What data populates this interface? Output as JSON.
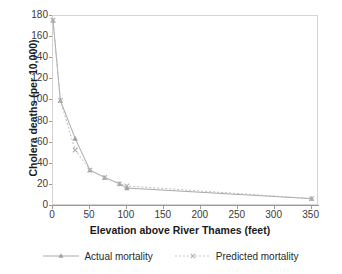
{
  "chart_data": {
    "type": "line",
    "title": "",
    "subtitle": "",
    "xlabel": "Elevation above River Thames (feet)",
    "ylabel": "Cholera deaths (per 10,000)",
    "xlim": [
      0,
      360
    ],
    "ylim": [
      0,
      180
    ],
    "xticks": [
      0,
      50,
      100,
      150,
      200,
      250,
      300,
      350
    ],
    "yticks": [
      0,
      20,
      40,
      60,
      80,
      100,
      120,
      140,
      160,
      180
    ],
    "xticklabels": [
      "0",
      "50",
      "100",
      "150",
      "200",
      "250",
      "300",
      "350"
    ],
    "yticklabels": [
      "0",
      "20",
      "40",
      "60",
      "80",
      "100",
      "120",
      "140",
      "160",
      "180"
    ],
    "grid": false,
    "legend_position": "bottom",
    "x": [
      0,
      10,
      30,
      50,
      70,
      90,
      100,
      350
    ],
    "series": [
      {
        "name": "Actual mortality",
        "values": [
          176,
          100,
          64,
          34,
          27,
          21,
          17,
          7
        ],
        "color": "#a9a9a9",
        "linestyle": "solid",
        "marker": "triangle"
      },
      {
        "name": "Predicted mortality",
        "values": [
          176,
          100,
          53,
          34,
          27,
          21,
          19,
          7
        ],
        "color": "#bdbdbd",
        "linestyle": "dotted",
        "marker": "x"
      }
    ]
  },
  "legend": {
    "entries": [
      {
        "label": "Actual mortality"
      },
      {
        "label": "Predicted mortality"
      }
    ]
  },
  "colors": {
    "actual": "#a9a9a9",
    "predicted": "#bdbdbd",
    "axis": "#9a9a9a",
    "frame": "#d4d4d4",
    "text": "#2a2a2a",
    "background": "#ffffff"
  }
}
